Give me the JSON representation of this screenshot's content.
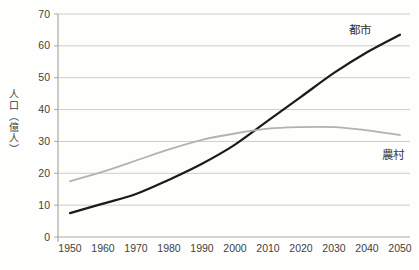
{
  "figure": {
    "background_color": "#fefefd"
  },
  "chart_data": {
    "type": "line",
    "title": "",
    "xlabel": "",
    "ylabel": "人口（億人）",
    "ylim": [
      0,
      70
    ],
    "yticks": [
      0,
      10,
      20,
      30,
      40,
      50,
      60,
      70
    ],
    "x": [
      1950,
      1960,
      1970,
      1980,
      1990,
      2000,
      2010,
      2020,
      2030,
      2040,
      2050
    ],
    "grid": true,
    "legend_position": "inline-labels",
    "series": [
      {
        "name": "都市",
        "color": "#1b1b1b",
        "line_width": 2.2,
        "values": [
          7.5,
          10.5,
          13.5,
          18,
          23,
          29,
          36.5,
          44,
          51.5,
          58,
          63.5
        ]
      },
      {
        "name": "農村",
        "color": "#b2b2ae",
        "line_width": 1.8,
        "values": [
          17.5,
          20.5,
          24,
          27.5,
          30.5,
          32.5,
          34,
          34.5,
          34.5,
          33.5,
          32
        ]
      }
    ],
    "axis_color": "#a8a8a4",
    "grid_color": "#cdcdca",
    "tick_color": "#424242",
    "tick_font_size": 10.5
  }
}
